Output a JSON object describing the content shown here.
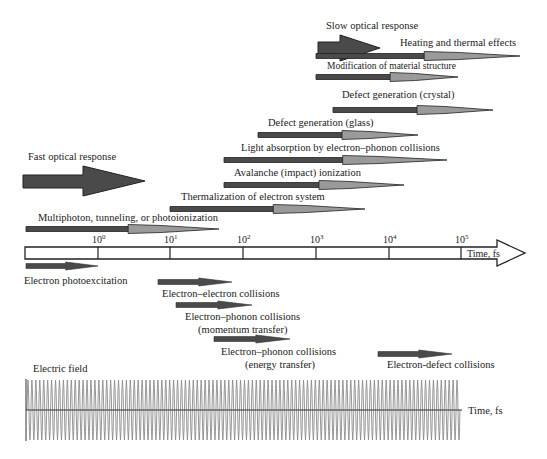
{
  "colors": {
    "dark_arrow": "#4a4a4a",
    "mid_arrow": "#8a8a8a",
    "light_arrow": "#a6a6a6",
    "outline": "#222222",
    "wave": "#8c8c8c",
    "text": "#222222"
  },
  "top_labels": {
    "slow_optical": "Slow optical response",
    "fast_optical": "Fast optical response"
  },
  "processes_above": [
    {
      "label": "Heating and thermal effects",
      "x1": 316,
      "x2": 520,
      "y": 56,
      "tx": 400,
      "ty": 46
    },
    {
      "label": "Modification of material structure",
      "x1": 316,
      "x2": 458,
      "y": 77,
      "tx": 327,
      "ty": 69,
      "small": true
    },
    {
      "label": "Defect generation (crystal)",
      "x1": 333,
      "x2": 493,
      "y": 110,
      "tx": 342,
      "ty": 98
    },
    {
      "label": "Defect generation (glass)",
      "x1": 258,
      "x2": 418,
      "y": 135,
      "tx": 268,
      "ty": 126
    },
    {
      "label": "Light absorption by electron–phonon collisions",
      "x1": 224,
      "x2": 447,
      "y": 160,
      "tx": 241,
      "ty": 151
    },
    {
      "label": "Avalanche (impact) ionization",
      "x1": 224,
      "x2": 404,
      "y": 185,
      "tx": 234,
      "ty": 176
    },
    {
      "label": "Thermalization of electron system",
      "x1": 170,
      "x2": 365,
      "y": 209,
      "tx": 181,
      "ty": 200
    },
    {
      "label": "Multiphoton, tunneling, or photoionization",
      "x1": 26,
      "x2": 219,
      "y": 229,
      "tx": 38,
      "ty": 221
    }
  ],
  "timeline": {
    "label": "Time, fs",
    "ticks": [
      {
        "base": "10",
        "exp": "0",
        "x": 98
      },
      {
        "base": "10",
        "exp": "1",
        "x": 170
      },
      {
        "base": "10",
        "exp": "2",
        "x": 243
      },
      {
        "base": "10",
        "exp": "3",
        "x": 316
      },
      {
        "base": "10",
        "exp": "4",
        "x": 389
      },
      {
        "base": "10",
        "exp": "5",
        "x": 461
      }
    ]
  },
  "processes_below": [
    {
      "label": "Electron photoexcitation",
      "x1": 26,
      "x2": 98,
      "y": 266,
      "tx": 24,
      "ty": 284
    },
    {
      "label": "Electron–electron collisions",
      "x1": 158,
      "x2": 232,
      "y": 282,
      "tx": 162,
      "ty": 297
    },
    {
      "label": "Electron–phonon collisions",
      "x1": 176,
      "x2": 252,
      "y": 305,
      "tx": 185,
      "ty": 320
    },
    {
      "label": "(momentum transfer)",
      "x1": null,
      "x2": null,
      "y": null,
      "tx": 198,
      "ty": 333
    },
    {
      "label": "Electron–phonon collisions",
      "x1": 214,
      "x2": 290,
      "y": 339,
      "tx": 221,
      "ty": 355
    },
    {
      "label": "(energy transfer)",
      "x1": null,
      "x2": null,
      "y": null,
      "tx": 245,
      "ty": 368
    },
    {
      "label": "Electron-defect collisions",
      "x1": 378,
      "x2": 452,
      "y": 354,
      "tx": 387,
      "ty": 368
    }
  ],
  "electric_field": {
    "label": "Electric field",
    "axis_label": "Time, fs",
    "cycles": 110
  },
  "chart_data": {
    "type": "timeline",
    "x_axis": {
      "label": "Time, fs",
      "scale": "log10",
      "ticks": [
        "10^0",
        "10^1",
        "10^2",
        "10^3",
        "10^4",
        "10^5"
      ]
    },
    "regimes": [
      {
        "name": "Fast optical response",
        "range_fs": [
          0.1,
          10
        ]
      },
      {
        "name": "Slow optical response",
        "range_fs": [
          1000,
          10000
        ]
      }
    ],
    "processes": [
      {
        "name": "Multiphoton, tunneling, or photoionization",
        "range_log10": [
          -1,
          1.7
        ]
      },
      {
        "name": "Thermalization of electron system",
        "range_log10": [
          1,
          3.7
        ]
      },
      {
        "name": "Avalanche (impact) ionization",
        "range_log10": [
          1.8,
          4.2
        ]
      },
      {
        "name": "Light absorption by electron–phonon collisions",
        "range_log10": [
          1.8,
          4.8
        ]
      },
      {
        "name": "Defect generation (glass)",
        "range_log10": [
          2.2,
          4.4
        ]
      },
      {
        "name": "Defect generation (crystal)",
        "range_log10": [
          3.2,
          5.4
        ]
      },
      {
        "name": "Modification of material structure",
        "range_log10": [
          3,
          4.9
        ]
      },
      {
        "name": "Heating and thermal effects",
        "range_log10": [
          3,
          5.8
        ]
      },
      {
        "name": "Electron photoexcitation",
        "range_log10": [
          -1,
          0
        ]
      },
      {
        "name": "Electron–electron collisions",
        "range_log10": [
          0.8,
          1.8
        ]
      },
      {
        "name": "Electron–phonon collisions (momentum transfer)",
        "range_log10": [
          1.1,
          2.1
        ]
      },
      {
        "name": "Electron–phonon collisions (energy transfer)",
        "range_log10": [
          1.6,
          2.6
        ]
      },
      {
        "name": "Electron-defect collisions",
        "range_log10": [
          3.8,
          4.8
        ]
      }
    ]
  }
}
